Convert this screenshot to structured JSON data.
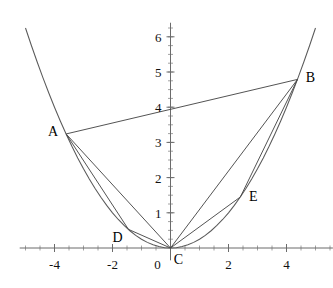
{
  "figure": {
    "title": "",
    "background_color": "#ffffff",
    "axis_color": "#6b6b6b",
    "curve_color": "#5a5a5a",
    "chord_color": "#4a4a4a",
    "label_color": "#111111"
  },
  "chart_data": {
    "type": "line",
    "title": "",
    "xlabel": "",
    "ylabel": "",
    "xlim": [
      -5.2,
      5.6
    ],
    "ylim": [
      -0.35,
      6.4
    ],
    "grid": false,
    "legend": "none",
    "curve": {
      "name": "parabola",
      "equation": "y = x^2 / 4",
      "x_start": -5.2,
      "x_end": 5.6,
      "sample_step": 0.2
    },
    "points": [
      {
        "label": "A",
        "x": -3.6,
        "y": 3.24,
        "label_dx": -13,
        "label_dy": 2
      },
      {
        "label": "B",
        "x": 4.38,
        "y": 4.79,
        "label_dx": 13,
        "label_dy": 3
      },
      {
        "label": "C",
        "x": 0.0,
        "y": 0.0,
        "label_dx": 8,
        "label_dy": 16
      },
      {
        "label": "D",
        "x": -1.45,
        "y": 0.53,
        "label_dx": -11,
        "label_dy": 13
      },
      {
        "label": "E",
        "x": 2.41,
        "y": 1.45,
        "label_dx": 13,
        "label_dy": 4
      }
    ],
    "segments": [
      {
        "from": "A",
        "to": "B"
      },
      {
        "from": "A",
        "to": "C"
      },
      {
        "from": "A",
        "to": "D"
      },
      {
        "from": "D",
        "to": "C"
      },
      {
        "from": "B",
        "to": "C"
      },
      {
        "from": "B",
        "to": "E"
      },
      {
        "from": "E",
        "to": "C"
      }
    ],
    "x_axis": {
      "tick_labels": [
        "-4",
        "-2",
        "0",
        "2",
        "4"
      ],
      "tick_values": [
        -4,
        -2,
        0,
        2,
        4
      ],
      "minor_tick_step": 0.5
    },
    "y_axis": {
      "tick_labels": [
        "1",
        "2",
        "3",
        "4",
        "5",
        "6"
      ],
      "tick_values": [
        1,
        2,
        3,
        4,
        5,
        6
      ],
      "minor_tick_step": 0.25
    }
  }
}
